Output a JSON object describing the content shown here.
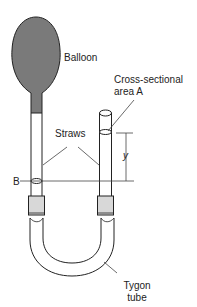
{
  "diagram": {
    "labels": {
      "balloon": "Balloon",
      "cross_section_line1": "Cross-sectional",
      "cross_section_line2": "area A",
      "straws": "Straws",
      "y": "y",
      "b": "B",
      "tygon_line1": "Tygon",
      "tygon_line2": "tube"
    },
    "colors": {
      "balloon_fill": "#7a7a7a",
      "stroke": "#222222",
      "connector_fill": "#d8d8d8"
    }
  }
}
